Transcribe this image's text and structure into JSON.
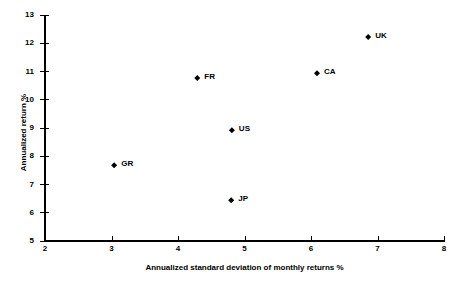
{
  "chart_data": {
    "type": "scatter",
    "title": "",
    "xlabel": "Annualized standard deviation of monthly returns %",
    "ylabel": "Annualized return %",
    "xlim": [
      2,
      8
    ],
    "ylim": [
      5,
      13
    ],
    "xticks": [
      "2",
      "3",
      "4",
      "5",
      "6",
      "7",
      "8"
    ],
    "yticks": [
      "5",
      "6",
      "7",
      "8",
      "9",
      "10",
      "11",
      "12",
      "13"
    ],
    "grid": false,
    "legend": "none",
    "marker_style": "filled-diamond",
    "marker_color": "#000000",
    "points": [
      {
        "label": "GR",
        "x": 3.04,
        "y": 7.68
      },
      {
        "label": "FR",
        "x": 4.29,
        "y": 10.77
      },
      {
        "label": "JP",
        "x": 4.8,
        "y": 6.44
      },
      {
        "label": "US",
        "x": 4.81,
        "y": 8.92
      },
      {
        "label": "CA",
        "x": 6.09,
        "y": 10.94
      },
      {
        "label": "UK",
        "x": 6.86,
        "y": 12.22
      }
    ]
  }
}
